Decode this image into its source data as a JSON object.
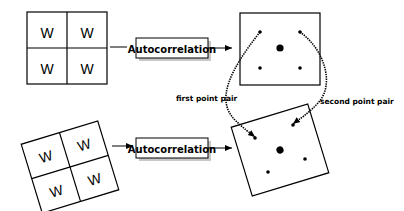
{
  "diagram": {
    "top_grid": {
      "cells": [
        "W",
        "W",
        "W",
        "W"
      ]
    },
    "bottom_grid": {
      "cells": [
        "W",
        "W",
        "W",
        "W"
      ],
      "rotation_deg": -17
    },
    "top_process": {
      "label": "Autocorrelation"
    },
    "bottom_process": {
      "label": "Autocorrelation"
    },
    "annotations": {
      "first": "first point pair",
      "second": "second point pair"
    },
    "colors": {
      "stroke": "#000000",
      "shadow": "#c8c8c8",
      "background": "#ffffff"
    }
  }
}
